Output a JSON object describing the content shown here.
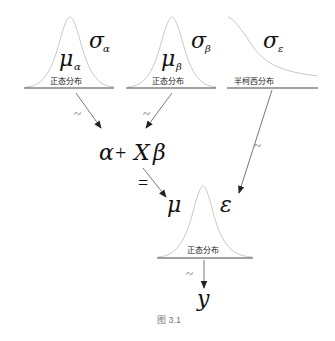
{
  "diagram": {
    "nodes": {
      "alpha_prior": {
        "mean": "μ",
        "mean_sub": "α",
        "sd": "σ",
        "sd_sub": "α",
        "dist_label": "正态分布"
      },
      "beta_prior": {
        "mean": "μ",
        "mean_sub": "β",
        "sd": "σ",
        "sd_sub": "β",
        "dist_label": "正态分布"
      },
      "epsilon_prior": {
        "sd": "σ",
        "sd_sub": "ε",
        "dist_label": "半柯西分布"
      },
      "linear_predictor": {
        "alpha": "α",
        "plus": "+",
        "x": "X",
        "beta": "β"
      },
      "equals": "=",
      "likelihood": {
        "mean": "μ",
        "sd": "ε",
        "dist_label": "正态分布"
      },
      "observed": "y"
    },
    "edge_labels": {
      "alpha_edge": "~",
      "beta_edge": "~",
      "epsilon_edge": "~",
      "y_edge": "~"
    },
    "caption": "图 3.1"
  }
}
